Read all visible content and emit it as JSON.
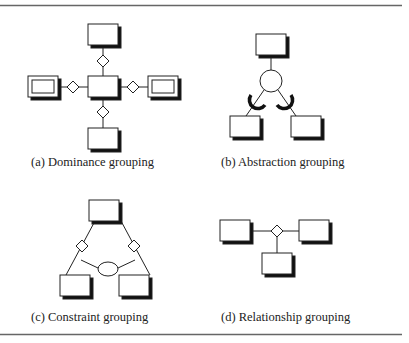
{
  "figure": {
    "panels": [
      {
        "id": "a",
        "caption": "(a) Dominance grouping"
      },
      {
        "id": "b",
        "caption": "(b) Abstraction grouping"
      },
      {
        "id": "c",
        "caption": "(c) Constraint grouping"
      },
      {
        "id": "d",
        "caption": "(d) Relationship grouping"
      }
    ]
  },
  "colors": {
    "stroke": "#222222",
    "shadow": "#111111",
    "rule": "#666666"
  }
}
